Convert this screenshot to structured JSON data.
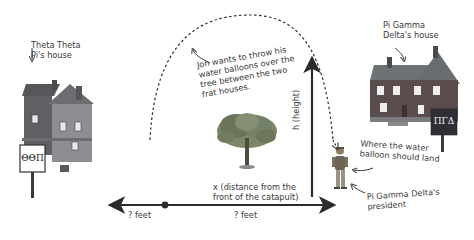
{
  "labels": {
    "theta_house": "Theta Theta\nPi's house",
    "pi_house": "Pi Gamma\nDelta's house",
    "jon_note": "Jon wants to throw his\nwater balloons over the\ntree between the two\nfrat houses.",
    "jon_note_underlined_word": "over",
    "height_axis": "h (height)",
    "distance_axis": "x (distance from the\nfront of the catapult)",
    "left_feet": "? feet",
    "right_feet": "? feet",
    "landing_note": "Where the water\nballoon should land",
    "president_note": "Pi Gamma Delta's\npresident"
  },
  "signs": {
    "theta": "ΘΘΠ",
    "pi": "ΠΓΔ"
  },
  "colors": {
    "ink": "#2b2b2b",
    "theta_house_roof": "#5b5e62",
    "theta_house_wall": "#8b8d90",
    "pi_house_roof": "#6a6d70",
    "pi_house_wall": "#5a4a4a",
    "pi_sign_bg": "#2f2f36",
    "tree": "#6f7a5c"
  }
}
